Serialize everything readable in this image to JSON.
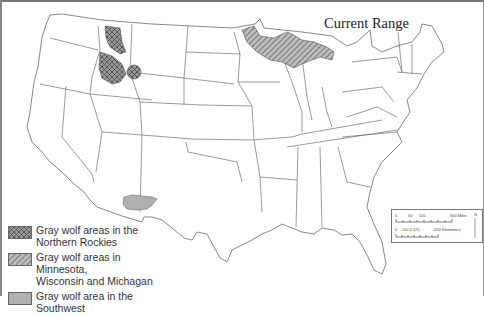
{
  "title": "Current Range",
  "legend": {
    "items": [
      {
        "key": "northern-rockies",
        "pattern": "crosshatch",
        "color": "#8a8a8a",
        "line1": "Gray wolf areas in the",
        "line2": "Northern Rockies"
      },
      {
        "key": "great-lakes",
        "pattern": "diagonal-hatch",
        "color": "#8a8a8a",
        "line1": "Gray wolf areas in Minnesota,",
        "line2": "Wisconsin and Michagan"
      },
      {
        "key": "southwest",
        "pattern": "solid",
        "color": "#b0b0b0",
        "line1": "Gray wolf area in the",
        "line2": "Southwest"
      }
    ]
  },
  "scale_bar": {
    "miles_ticks": [
      "0",
      "50",
      "100",
      "",
      "300 Miles"
    ],
    "km_ticks": [
      "0",
      "112.5 225",
      "450 Kilometers"
    ],
    "north_label": "N"
  },
  "map": {
    "region": "Contiguous United States",
    "state_fill": "#ffffff",
    "border_color": "#555555",
    "range_fill_color": "#8a8a8a"
  }
}
